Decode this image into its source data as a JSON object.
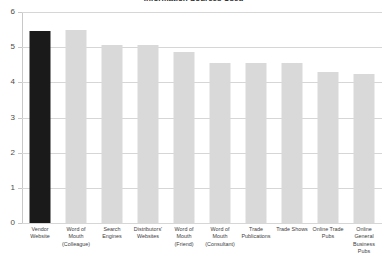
{
  "chart_data": {
    "type": "bar",
    "title": "Information Sources Used",
    "xlabel": "",
    "ylabel": "",
    "ylim": [
      0,
      6
    ],
    "yticks": [
      0,
      1,
      2,
      3,
      4,
      5,
      6
    ],
    "ytick_labels": [
      "0",
      "1",
      "2",
      "3",
      "4",
      "5",
      "6"
    ],
    "grid": true,
    "legend": "none",
    "highlight_color": "#1a1a1a",
    "bar_color": "#d9d9d9",
    "gridline_color": "#d6d6d6",
    "categories": [
      "Vendor Website",
      "Word of Mouth (Colleague)",
      "Search Engines",
      "Distributors' Websites",
      "Word of Mouth (Friend)",
      "Word of Mouth (Consultant)",
      "Trade Publications",
      "Trade Shows",
      "Online Trade Pubs",
      "Online General Business Pubs"
    ],
    "category_lines": [
      [
        "Vendor",
        "Website"
      ],
      [
        "Word of",
        "Mouth",
        "(Colleague)"
      ],
      [
        "Search",
        "Engines"
      ],
      [
        "Distributors'",
        "Websites"
      ],
      [
        "Word of",
        "Mouth",
        "(Friend)"
      ],
      [
        "Word of",
        "Mouth",
        "(Consultant)"
      ],
      [
        "Trade",
        "Publications"
      ],
      [
        "Trade Shows"
      ],
      [
        "Online Trade",
        "Pubs"
      ],
      [
        "Online",
        "General",
        "Business",
        "Pubs"
      ]
    ],
    "values": [
      5.45,
      5.5,
      5.05,
      5.07,
      4.85,
      4.55,
      4.55,
      4.55,
      4.3,
      4.25
    ],
    "highlight_index": 0
  }
}
